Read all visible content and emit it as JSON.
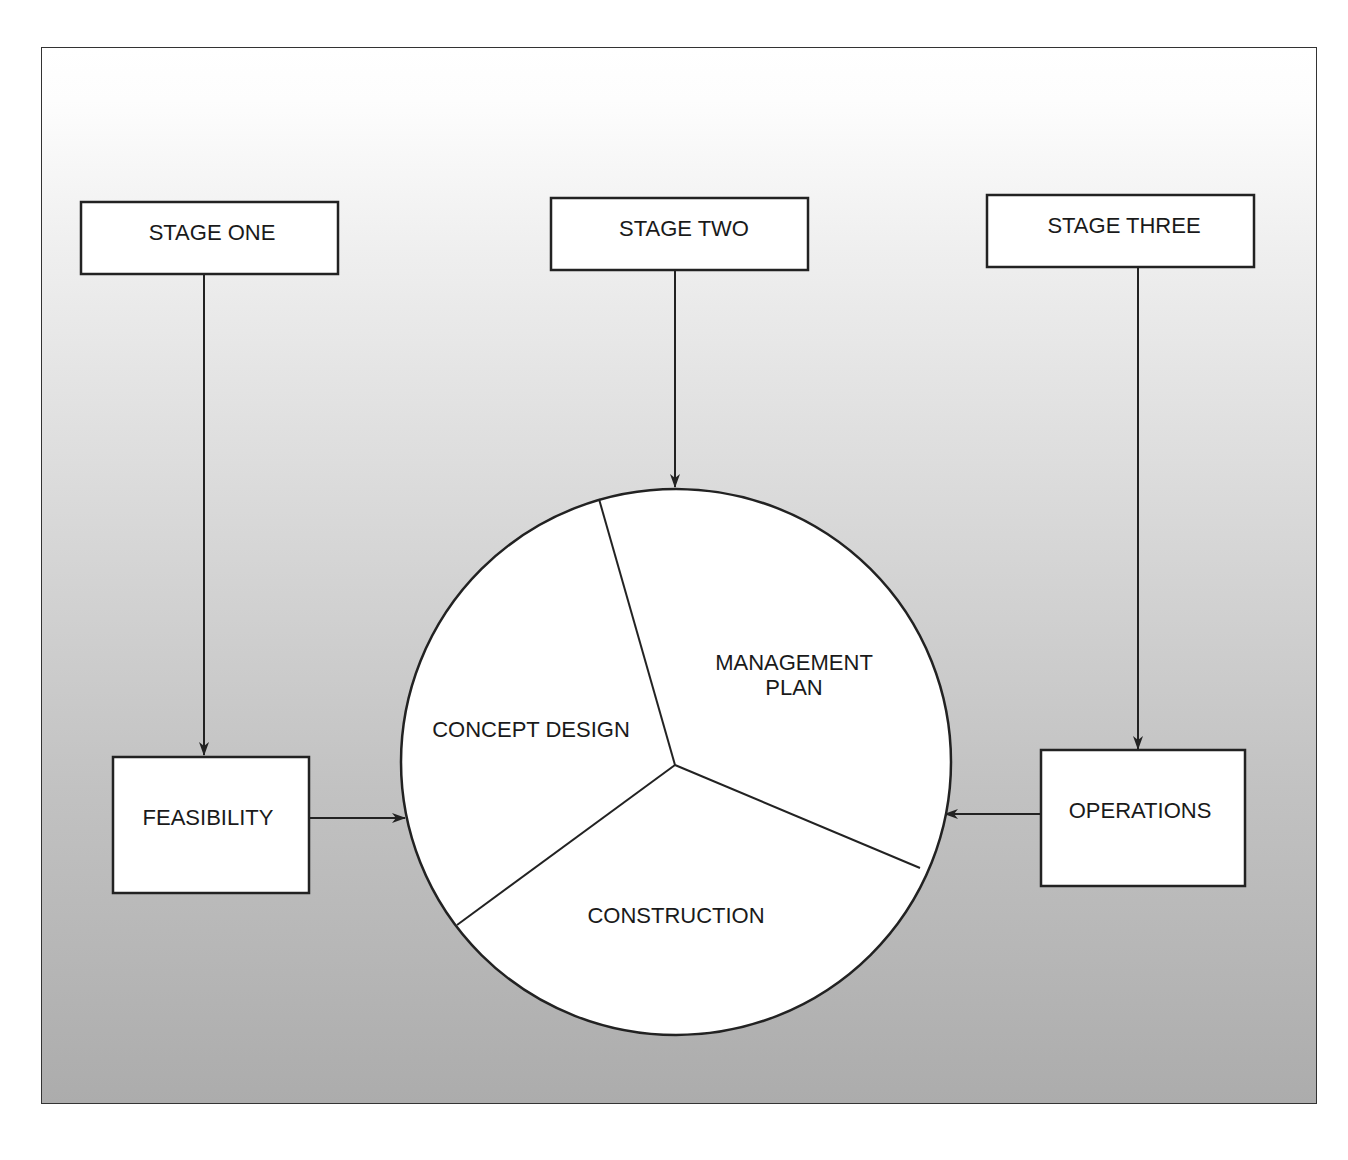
{
  "diagram": {
    "stages": [
      {
        "id": "stage-one",
        "label": "STAGE ONE"
      },
      {
        "id": "stage-two",
        "label": "STAGE TWO"
      },
      {
        "id": "stage-three",
        "label": "STAGE THREE"
      }
    ],
    "side_boxes": {
      "left": {
        "label": "FEASIBILITY"
      },
      "right": {
        "label": "OPERATIONS"
      }
    },
    "circle_segments": [
      {
        "label": "CONCEPT DESIGN"
      },
      {
        "label_line1": "MANAGEMENT",
        "label_line2": "PLAN"
      },
      {
        "label": "CONSTRUCTION"
      }
    ],
    "colors": {
      "background_top": "#ffffff",
      "background_bottom": "#acacac",
      "stroke": "#222222",
      "box_fill": "#ffffff"
    }
  }
}
